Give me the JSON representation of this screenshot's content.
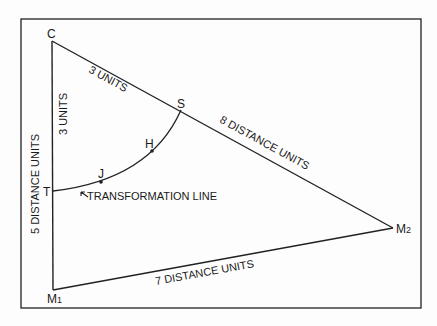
{
  "diagram": {
    "points": {
      "C": "C",
      "S": "S",
      "H": "H",
      "J": "J",
      "T": "T",
      "M1": "M",
      "M1_sub": "1",
      "M2": "M",
      "M2_sub": "2"
    },
    "labels": {
      "cs": "3 UNITS",
      "ct": "3 UNITS",
      "sm2": "8 DISTANCE UNITS",
      "cm1": "5 DISTANCE UNITS",
      "m1m2": "7 DISTANCE UNITS",
      "transformation": "TRANSFORMATION LINE"
    }
  }
}
